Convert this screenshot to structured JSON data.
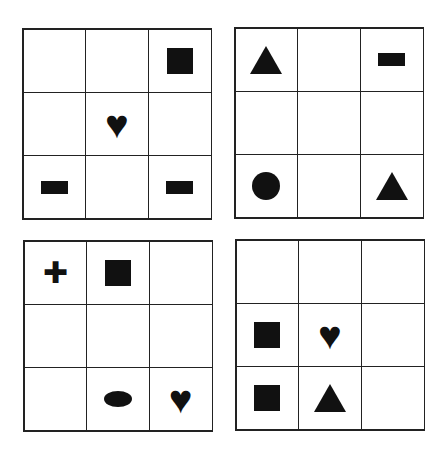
{
  "puzzle": {
    "grids": [
      {
        "name": "top-left",
        "cells": [
          "",
          "",
          "square",
          "",
          "heart",
          "",
          "bar",
          "",
          "bar"
        ]
      },
      {
        "name": "top-right",
        "cells": [
          "triangle",
          "",
          "bar",
          "",
          "",
          "",
          "circle",
          "",
          "triangle"
        ]
      },
      {
        "name": "bottom-left",
        "cells": [
          "cross",
          "square",
          "",
          "",
          "",
          "",
          "",
          "oval",
          "heart"
        ]
      },
      {
        "name": "bottom-right",
        "cells": [
          "",
          "",
          "",
          "square",
          "heart",
          "",
          "square",
          "triangle",
          ""
        ]
      }
    ],
    "glyphs": {
      "heart": "♥",
      "cross": "✚"
    },
    "colors": {
      "shape": "#111111",
      "line": "#222222",
      "background": "#ffffff"
    }
  }
}
